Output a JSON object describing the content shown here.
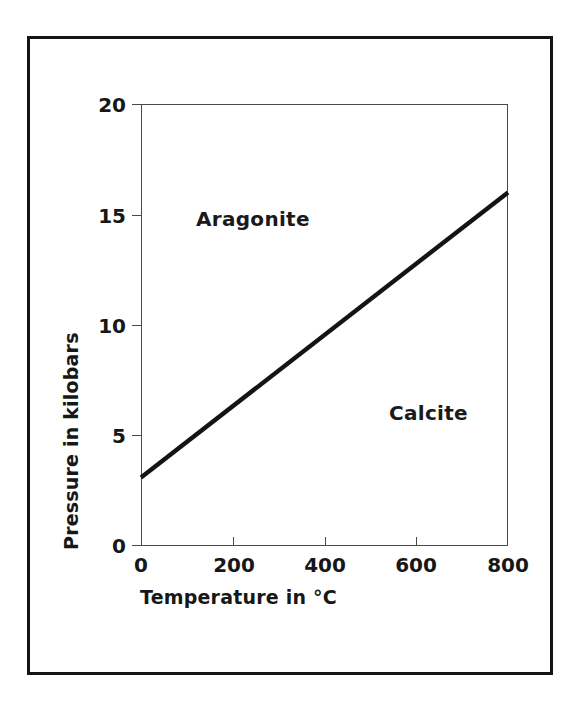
{
  "figure": {
    "frame_color": "#141414",
    "background": "#ffffff"
  },
  "chart_data": {
    "type": "line",
    "title": "",
    "subtitle": "",
    "xlabel": "Temperature in °C",
    "ylabel": "Pressure in kilobars",
    "xlim": [
      0,
      800
    ],
    "ylim": [
      0,
      20
    ],
    "xticks": [
      0,
      200,
      400,
      600,
      800
    ],
    "yticks": [
      0,
      5,
      10,
      15,
      20
    ],
    "xticklabels": [
      "0",
      "200",
      "400",
      "600",
      "800"
    ],
    "yticklabels": [
      "0",
      "5",
      "10",
      "15",
      "20"
    ],
    "grid": false,
    "legend": "none",
    "series": [
      {
        "name": "Calcite–Aragonite phase boundary",
        "color": "#141414",
        "linewidth": 4,
        "x": [
          0,
          800
        ],
        "y": [
          3.1,
          16.0
        ]
      }
    ],
    "annotations": [
      {
        "text": "Aragonite",
        "x": 130,
        "y": 15.0,
        "bold": true
      },
      {
        "text": "Calcite",
        "x": 560,
        "y": 6.4,
        "bold": true
      }
    ]
  },
  "axes": {
    "x_title": "Temperature in °C",
    "y_title": "Pressure in kilobars",
    "x_tick_labels": [
      "0",
      "200",
      "400",
      "600",
      "800"
    ],
    "y_tick_labels": [
      "0",
      "5",
      "10",
      "15",
      "20"
    ]
  },
  "regions": {
    "upper_left": "Aragonite",
    "lower_right": "Calcite"
  }
}
